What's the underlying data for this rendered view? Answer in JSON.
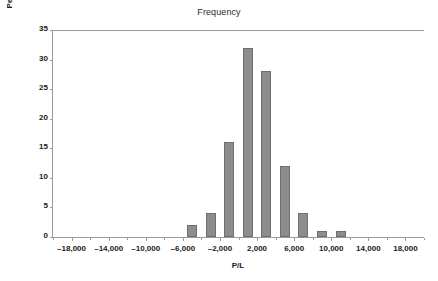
{
  "chart_data": {
    "type": "bar",
    "title": "Frequency",
    "xlabel": "P/L",
    "ylabel": "Percentage of Observations",
    "categories": [
      -5000,
      -3000,
      -1000,
      1000,
      3000,
      5000,
      7000,
      9000,
      11000
    ],
    "values": [
      2,
      4,
      16,
      32,
      28,
      12,
      4,
      1,
      1
    ],
    "xlim": [
      -20000,
      20000
    ],
    "ylim": [
      0,
      35
    ],
    "x_ticks": [
      -18000,
      -14000,
      -10000,
      -6000,
      -2000,
      2000,
      6000,
      10000,
      14000,
      18000
    ],
    "x_tick_labels": [
      "–18,000",
      "–14,000",
      "–10,000",
      "–6,000",
      "–2,000",
      "2,000",
      "6,000",
      "10,000",
      "14,000",
      "18,000"
    ],
    "x_minor_ticks": [
      -20000,
      -16000,
      -12000,
      -8000,
      -4000,
      0,
      4000,
      8000,
      12000,
      16000,
      20000
    ],
    "y_ticks": [
      0,
      5,
      10,
      15,
      20,
      25,
      30,
      35
    ],
    "y_tick_labels": [
      "0",
      "5",
      "10",
      "15",
      "20",
      "25",
      "30",
      "35"
    ],
    "grid": false,
    "legend": false,
    "bar_color": "#8d8d8d",
    "bar_edge_color": "#6f6f6f",
    "axis_color": "#9a9a9a",
    "bin_width": 2000
  }
}
